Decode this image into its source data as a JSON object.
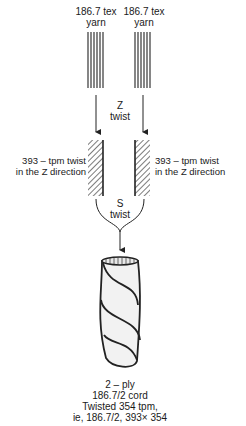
{
  "yarn_left": {
    "line1": "186.7 tex",
    "line2": "yarn"
  },
  "yarn_right": {
    "line1": "186.7 tex",
    "line2": "yarn"
  },
  "z_twist": {
    "line1": "Z",
    "line2": "twist"
  },
  "twisted_left": {
    "line1": "393 – tpm twist",
    "line2": "in the Z direction"
  },
  "twisted_right": {
    "line1": "393 – tpm twist",
    "line2": "in the Z direction"
  },
  "s_twist": {
    "line1": "S",
    "line2": "twist"
  },
  "cord": {
    "line1": "2 – ply",
    "line2": "186.7/2 cord",
    "line3": "Twisted 354 tpm,",
    "line4": "ie, 186.7/2, 393× 354"
  }
}
